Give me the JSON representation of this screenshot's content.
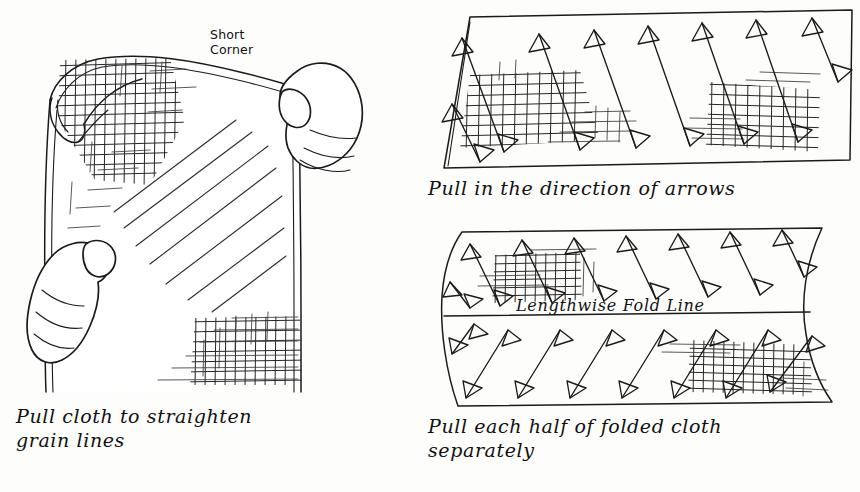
{
  "figure": {
    "ink_color": "#1a1a1a",
    "background_color": "#fdfdfc"
  },
  "panels": {
    "left": {
      "name": "pull-cloth-illustration",
      "caption": "Pull cloth to straighten\ngrain lines",
      "corner_label": "Short\nCorner",
      "elements": {
        "cloth": "draped rectangular cloth held diagonally",
        "top_hand": "right hand gripping short corner",
        "bottom_hand": "left hand gripping opposite corner",
        "grain_patch_top": "crosshatch grain texture at folded top corner",
        "grain_patch_bottom": "crosshatch grain texture at lower right",
        "motion_lines": "diagonal stress lines across cloth"
      }
    },
    "top_right": {
      "name": "pull-direction-panel",
      "caption": "Pull in the direction of arrows",
      "shape": "skewed rectangle of flat cloth",
      "arrow_count": 8,
      "arrow_direction": "upper-left to lower-right (bias)",
      "arrow_style": "double-headed open triangles",
      "grain_patches": 2
    },
    "bottom_right": {
      "name": "folded-cloth-panel",
      "caption": "Pull each half of folded cloth\nseparately",
      "fold_label": "Lengthwise Fold Line",
      "shape": "folded cloth with curved right edge",
      "upper_half": {
        "arrow_count": 7,
        "arrow_direction": "upper-left to lower-right",
        "grain_patches": 1
      },
      "lower_half": {
        "arrow_count": 8,
        "arrow_direction": "lower-left to upper-right",
        "grain_patches": 1
      }
    }
  }
}
